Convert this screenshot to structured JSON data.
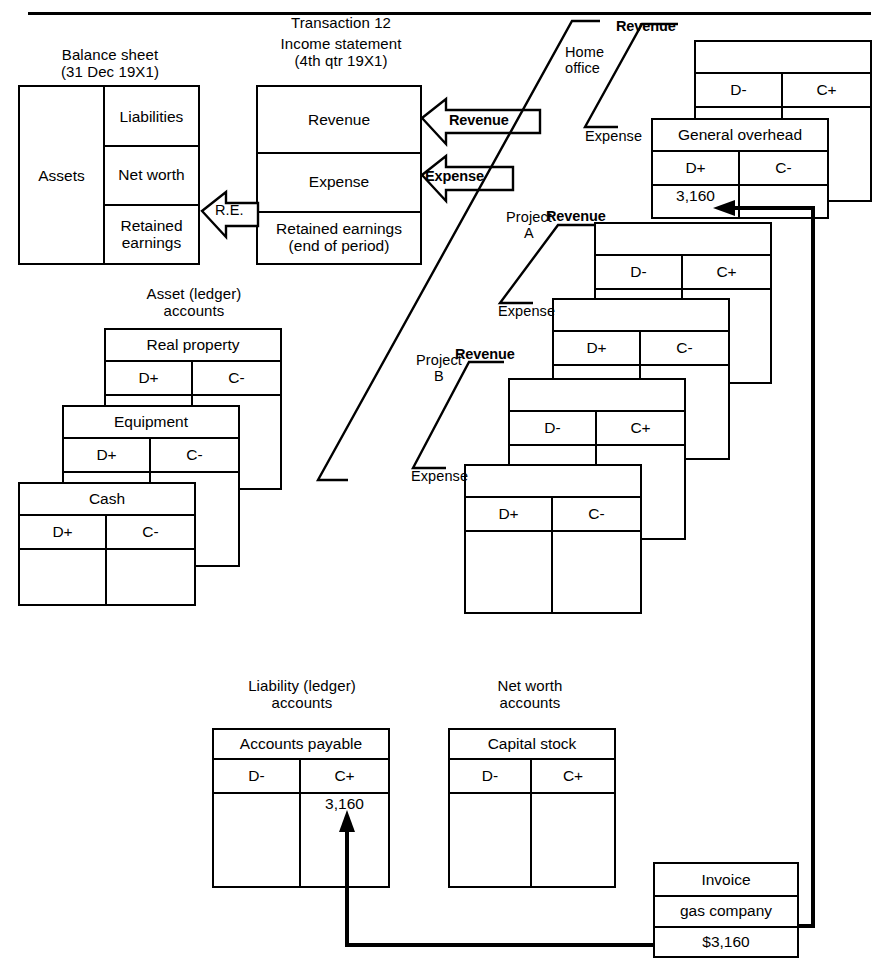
{
  "figure": {
    "transaction_title": "Transaction 12"
  },
  "balance_sheet": {
    "caption": "Balance sheet\n(31 Dec 19X1)",
    "assets": "Assets",
    "liabilities": "Liabilities",
    "net_worth": "Net worth",
    "retained_earnings": "Retained\nearnings"
  },
  "income_statement": {
    "caption": "Income statement\n(4th qtr 19X1)",
    "revenue": "Revenue",
    "expense": "Expense",
    "retained_earnings": "Retained earnings\n(end of period)"
  },
  "arrows": {
    "re_label": "R.E.",
    "revenue_label": "Revenue",
    "expense_label": "Expense"
  },
  "asset_accounts": {
    "caption": "Asset (ledger)\naccounts",
    "items": [
      {
        "title": "Real property",
        "debit": "D+",
        "credit": "C-",
        "debit_value": "",
        "credit_value": ""
      },
      {
        "title": "Equipment",
        "debit": "D+",
        "credit": "C-",
        "debit_value": "",
        "credit_value": ""
      },
      {
        "title": "Cash",
        "debit": "D+",
        "credit": "C-",
        "debit_value": "",
        "credit_value": ""
      }
    ]
  },
  "liability_accounts": {
    "caption": "Liability (ledger)\naccounts",
    "items": [
      {
        "title": "Accounts payable",
        "debit": "D-",
        "credit": "C+",
        "debit_value": "",
        "credit_value": "3,160"
      }
    ]
  },
  "net_worth_accounts": {
    "caption": "Net worth\naccounts",
    "items": [
      {
        "title": "Capital stock",
        "debit": "D-",
        "credit": "C+",
        "debit_value": "",
        "credit_value": ""
      }
    ]
  },
  "segments": {
    "home_office": {
      "name": "Home\noffice",
      "revenue_label": "Revenue",
      "expense_label": "Expense",
      "revenue_account": {
        "title": "",
        "debit": "D-",
        "credit": "C+",
        "debit_value": "",
        "credit_value": ""
      },
      "expense_account": {
        "title": "General overhead",
        "debit": "D+",
        "credit": "C-",
        "debit_value": "3,160",
        "credit_value": ""
      }
    },
    "project_a": {
      "name": "Project\nA",
      "revenue_label": "Revenue",
      "expense_label": "Expense",
      "revenue_account": {
        "title": "",
        "debit": "D-",
        "credit": "C+",
        "debit_value": "",
        "credit_value": ""
      },
      "expense_account": {
        "title": "",
        "debit": "D+",
        "credit": "C-",
        "debit_value": "",
        "credit_value": ""
      }
    },
    "project_b": {
      "name": "Project\nB",
      "revenue_label": "Revenue",
      "expense_label": "Expense",
      "revenue_account": {
        "title": "",
        "debit": "D-",
        "credit": "C+",
        "debit_value": "",
        "credit_value": ""
      },
      "expense_account": {
        "title": "",
        "debit": "D+",
        "credit": "C-",
        "debit_value": "",
        "credit_value": ""
      }
    }
  },
  "invoice": {
    "title": "Invoice",
    "vendor": "gas company",
    "amount": "$3,160"
  },
  "colors": {
    "ink": "#000000",
    "paper": "#ffffff"
  }
}
